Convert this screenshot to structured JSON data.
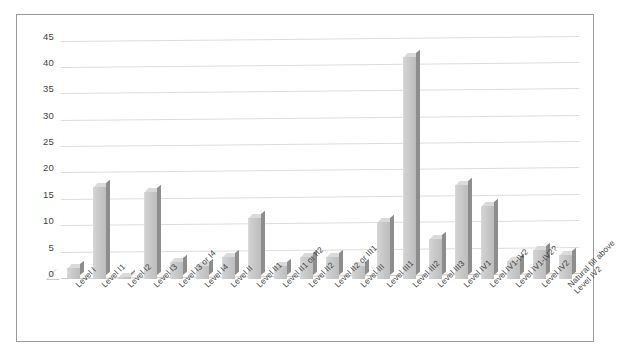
{
  "chart_data": {
    "type": "bar",
    "title": "",
    "subtitle": "",
    "xlabel": "",
    "ylabel": "",
    "ylim": [
      0,
      47
    ],
    "grid": true,
    "legend": false,
    "style": "3d-column",
    "yticks": [
      0,
      5,
      10,
      15,
      20,
      25,
      30,
      35,
      40,
      45
    ],
    "categories": [
      "Level I",
      "Level I1",
      "Level I2",
      "Level I3",
      "Level I3 or I4",
      "Level I4",
      "Level II",
      "Level II1",
      "Level II1 or II2",
      "Level II2",
      "Level II2 or III1",
      "Level III",
      "Level III1",
      "Level III2",
      "Level III3",
      "Level IV1",
      "Level IV1-IV2",
      "Level IV1-IV2?",
      "Level IV2",
      "Natural fill above Level IV2"
    ],
    "values": [
      2,
      17.5,
      0.3,
      16.5,
      3.3,
      2.5,
      4.2,
      11.5,
      2.5,
      4.2,
      4.2,
      2.5,
      10.8,
      42,
      7.5,
      17.8,
      13.8,
      3.5,
      5.5,
      4.5
    ],
    "series": [
      {
        "name": "Count",
        "values": [
          2,
          17.5,
          0.3,
          16.5,
          3.3,
          2.5,
          4.2,
          11.5,
          2.5,
          4.2,
          4.2,
          2.5,
          10.8,
          42,
          7.5,
          17.8,
          13.8,
          3.5,
          5.5,
          4.5
        ]
      }
    ]
  },
  "colors": {
    "bar_front": "#c6c6c6",
    "bar_side": "#8d8d8d",
    "bar_top": "#dadada",
    "gridline": "#dcdcdc",
    "border": "#9a9a9a",
    "text": "#3f3f3f",
    "background": "#ffffff"
  }
}
